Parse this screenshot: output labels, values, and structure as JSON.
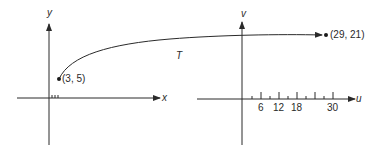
{
  "diagram": {
    "left_plane": {
      "x_axis_label": "x",
      "y_axis_label": "y",
      "start_point_label": "(3, 5)"
    },
    "transformation_label": "T",
    "right_plane": {
      "u_axis_label": "u",
      "v_axis_label": "v",
      "end_point_label": "(29, 21)",
      "u_tick_labels": [
        "6",
        "12",
        "18",
        "30"
      ]
    }
  }
}
